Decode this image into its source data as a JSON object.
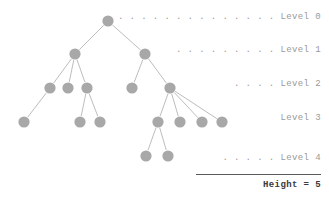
{
  "figure": {
    "title_text": "Height = 5",
    "node_color": "#a8a8a8",
    "edge_color": "#b5b5b5",
    "label_color": "#9a9a9a",
    "rule_color": "#5a5a5a",
    "background": "#ffffff",
    "node_radius": 5.6
  },
  "labels": [
    {
      "id": "level-0",
      "leader": ". . . . . . . . . . . . . .",
      "text": "Level 0",
      "full": ". . . . . . . . . . . . . . Level 0",
      "x": 321,
      "y": 17
    },
    {
      "id": "level-1",
      "leader": ". . . . . . . . .",
      "text": "Level 1",
      "full": ". . . . . . . . . Level 1",
      "x": 321,
      "y": 50
    },
    {
      "id": "level-2",
      "leader": ". . . .",
      "text": "Level 2",
      "full": ". . . . Level 2",
      "x": 321,
      "y": 84
    },
    {
      "id": "level-3",
      "leader": "",
      "text": "Level 3",
      "full": "Level 3",
      "x": 321,
      "y": 118
    },
    {
      "id": "level-4",
      "leader": ". . . . .",
      "text": "Level 4",
      "full": ". . . . . Level 4",
      "x": 321,
      "y": 158
    }
  ],
  "summary": {
    "label": "Height = 5",
    "rule_left": 196,
    "rule_top": 174,
    "rule_width": 125,
    "text_top": 180
  },
  "chart_data": {
    "type": "diagram",
    "diagram_kind": "tree",
    "title": "Height = 5",
    "levels": [
      {
        "level": 0,
        "count": 1,
        "y": 21
      },
      {
        "level": 1,
        "count": 2,
        "y": 54
      },
      {
        "level": 2,
        "count": 5,
        "y": 88
      },
      {
        "level": 3,
        "count": 7,
        "y": 122
      },
      {
        "level": 4,
        "count": 2,
        "y": 156
      }
    ],
    "nodes": [
      {
        "id": "n0",
        "level": 0,
        "x": 108,
        "y": 21
      },
      {
        "id": "n1a",
        "level": 1,
        "x": 75,
        "y": 54
      },
      {
        "id": "n1b",
        "level": 1,
        "x": 145,
        "y": 54
      },
      {
        "id": "n2a",
        "level": 2,
        "x": 50,
        "y": 88
      },
      {
        "id": "n2b",
        "level": 2,
        "x": 68,
        "y": 88
      },
      {
        "id": "n2c",
        "level": 2,
        "x": 87,
        "y": 88
      },
      {
        "id": "n2d",
        "level": 2,
        "x": 132,
        "y": 88
      },
      {
        "id": "n2e",
        "level": 2,
        "x": 170,
        "y": 88
      },
      {
        "id": "n3a",
        "level": 3,
        "x": 24,
        "y": 122
      },
      {
        "id": "n3b",
        "level": 3,
        "x": 80,
        "y": 122
      },
      {
        "id": "n3c",
        "level": 3,
        "x": 100,
        "y": 122
      },
      {
        "id": "n3d",
        "level": 3,
        "x": 158,
        "y": 122
      },
      {
        "id": "n3e",
        "level": 3,
        "x": 180,
        "y": 122
      },
      {
        "id": "n3f",
        "level": 3,
        "x": 202,
        "y": 122
      },
      {
        "id": "n3g",
        "level": 3,
        "x": 222,
        "y": 122
      },
      {
        "id": "n4a",
        "level": 4,
        "x": 146,
        "y": 156
      },
      {
        "id": "n4b",
        "level": 4,
        "x": 168,
        "y": 156
      }
    ],
    "edges": [
      [
        "n0",
        "n1a"
      ],
      [
        "n0",
        "n1b"
      ],
      [
        "n1a",
        "n2a"
      ],
      [
        "n1a",
        "n2b"
      ],
      [
        "n1a",
        "n2c"
      ],
      [
        "n1b",
        "n2d"
      ],
      [
        "n1b",
        "n2e"
      ],
      [
        "n2a",
        "n3a"
      ],
      [
        "n2c",
        "n3b"
      ],
      [
        "n2c",
        "n3c"
      ],
      [
        "n2e",
        "n3d"
      ],
      [
        "n2e",
        "n3e"
      ],
      [
        "n2e",
        "n3f"
      ],
      [
        "n2e",
        "n3g"
      ],
      [
        "n3d",
        "n4a"
      ],
      [
        "n3d",
        "n4b"
      ]
    ]
  }
}
